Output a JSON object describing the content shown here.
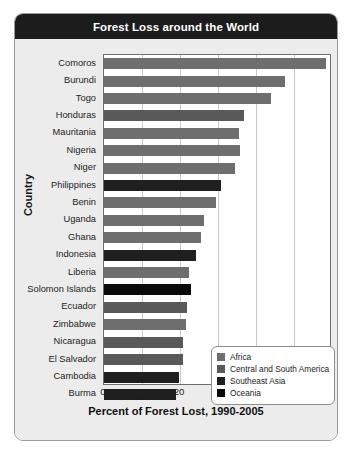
{
  "header": {
    "title": "Forest Loss around the World"
  },
  "chart_data": {
    "type": "bar",
    "orientation": "horizontal",
    "title": "Forest Loss around the World",
    "xlabel": "Percent of Forest Lost, 1990-2005",
    "ylabel": "Country",
    "xlim": [
      0,
      60
    ],
    "xticks": [
      0,
      10,
      20,
      30,
      40,
      50
    ],
    "grid": true,
    "legend_position": "bottom-right",
    "categories": [
      "Comoros",
      "Burundi",
      "Togo",
      "Honduras",
      "Mauritania",
      "Nigeria",
      "Niger",
      "Philippines",
      "Benin",
      "Uganda",
      "Ghana",
      "Indonesia",
      "Liberia",
      "Solomon Islands",
      "Ecuador",
      "Zimbabwe",
      "Nicaragua",
      "El Salvador",
      "Cambodia",
      "Burma"
    ],
    "values": [
      58.4,
      47.5,
      44.0,
      36.8,
      35.5,
      35.8,
      34.5,
      30.8,
      29.5,
      26.3,
      25.5,
      24.2,
      22.4,
      22.9,
      21.8,
      21.6,
      20.8,
      20.8,
      19.7,
      18.9
    ],
    "groups": [
      "Africa",
      "Africa",
      "Africa",
      "Central and South America",
      "Africa",
      "Africa",
      "Africa",
      "Southeast Asia",
      "Africa",
      "Africa",
      "Africa",
      "Southeast Asia",
      "Africa",
      "Oceania",
      "Central and South America",
      "Africa",
      "Central and South America",
      "Central and South America",
      "Southeast Asia",
      "Southeast Asia"
    ],
    "legend": [
      {
        "label": "Africa",
        "color": "#6e6e6e"
      },
      {
        "label": "Central and South America",
        "color": "#595959"
      },
      {
        "label": "Southeast Asia",
        "color": "#1f1f1f"
      },
      {
        "label": "Oceania",
        "color": "#0a0a0a"
      }
    ]
  }
}
